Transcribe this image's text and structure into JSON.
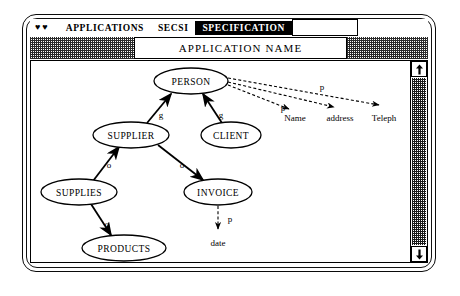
{
  "window": {
    "menubar": {
      "hearts_icon": "♥♥",
      "items": [
        {
          "label": "APPLICATIONS",
          "selected": false
        },
        {
          "label": "SECSI",
          "selected": false
        },
        {
          "label": "SPECIFICATION",
          "selected": true
        }
      ]
    },
    "toolbar": {
      "application_name_label": "APPLICATION NAME"
    },
    "scrollbar": {
      "up_arrow_icon": "scroll-up-icon",
      "down_arrow_icon": "scroll-down-icon"
    }
  },
  "diagram": {
    "type": "entity-graph",
    "nodes": [
      {
        "id": "person",
        "label": "PERSON",
        "cx": 160,
        "cy": 20,
        "rx": 37,
        "ry": 13
      },
      {
        "id": "supplier",
        "label": "SUPPLIER",
        "cx": 100,
        "cy": 74,
        "rx": 38,
        "ry": 13
      },
      {
        "id": "client",
        "label": "CLIENT",
        "cx": 200,
        "cy": 74,
        "rx": 30,
        "ry": 13
      },
      {
        "id": "supplies",
        "label": "SUPPLIES",
        "cx": 48,
        "cy": 131,
        "rx": 38,
        "ry": 13
      },
      {
        "id": "invoice",
        "label": "INVOICE",
        "cx": 187,
        "cy": 131,
        "rx": 34,
        "ry": 13
      },
      {
        "id": "products",
        "label": "PRODUCTS",
        "cx": 93,
        "cy": 187,
        "rx": 42,
        "ry": 13
      }
    ],
    "attributes": [
      {
        "id": "name",
        "label": "Name",
        "x": 264,
        "y": 57
      },
      {
        "id": "address",
        "label": "address",
        "x": 309,
        "y": 57
      },
      {
        "id": "teleph",
        "label": "Teleph",
        "x": 353,
        "y": 57
      }
    ],
    "edges": [
      {
        "id": "supplier-person",
        "from": "SUPPLIER",
        "to": "PERSON",
        "label": "g",
        "style": "solid",
        "lx": 130,
        "ly": 54
      },
      {
        "id": "client-person",
        "from": "CLIENT",
        "to": "PERSON",
        "label": "g",
        "style": "solid",
        "lx": 190,
        "ly": 54
      },
      {
        "id": "supplies-supplier",
        "from": "SUPPLIES",
        "to": "SUPPLIER",
        "label": "o",
        "style": "solid",
        "lx": 80,
        "ly": 104
      },
      {
        "id": "supplier-invoice",
        "from": "SUPPLIER",
        "to": "INVOICE",
        "label": "o",
        "style": "solid",
        "lx": 153,
        "ly": 104
      },
      {
        "id": "supplies-products",
        "from": "SUPPLIES",
        "to": "PRODUCTS",
        "label": "o",
        "style": "solid",
        "lx": 78,
        "ly": 163
      },
      {
        "id": "person-name",
        "from": "PERSON",
        "to": "Name",
        "label": "p",
        "style": "dashed",
        "lx": 250,
        "ly": 44
      },
      {
        "id": "person-address",
        "from": "PERSON",
        "to": "address",
        "label": "",
        "style": "dashed",
        "lx": 0,
        "ly": 0
      },
      {
        "id": "person-teleph",
        "from": "PERSON",
        "to": "Teleph",
        "label": "p",
        "style": "dashed",
        "lx": 295,
        "ly": 26
      },
      {
        "id": "invoice-date",
        "from": "INVOICE",
        "to": "date",
        "label": "p",
        "style": "dashed",
        "lx": 197,
        "ly": 161
      }
    ],
    "date_attribute": {
      "label": "date",
      "x": 187,
      "y": 182
    }
  }
}
